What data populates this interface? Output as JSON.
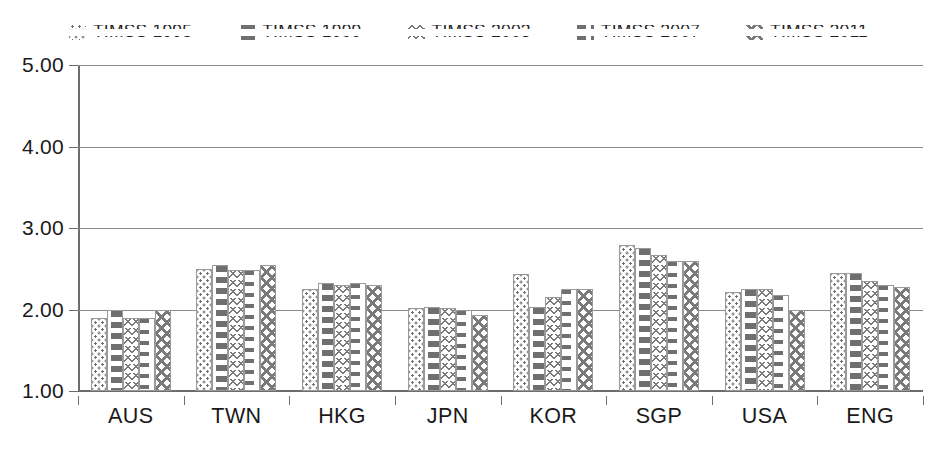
{
  "chart_data": {
    "type": "bar",
    "title": "",
    "subtitle": "",
    "xlabel": "",
    "ylabel": "",
    "ylim": [
      1.0,
      5.0
    ],
    "ytick_step": 1.0,
    "ytick_labels": [
      "1.00",
      "2.00",
      "3.00",
      "4.00",
      "5.00"
    ],
    "ytick_values": [
      1.0,
      2.0,
      3.0,
      4.0,
      5.0
    ],
    "grid": "horizontal",
    "legend_position": "top-center",
    "baseline": 1.0,
    "categories": [
      "AUS",
      "TWN",
      "HKG",
      "JPN",
      "KOR",
      "SGP",
      "USA",
      "ENG"
    ],
    "series": [
      {
        "name": "TIMSS 1995",
        "pattern": "dots",
        "values": [
          1.9,
          2.5,
          2.25,
          2.02,
          2.43,
          2.79,
          2.22,
          2.45
        ]
      },
      {
        "name": "TIMSS 1999",
        "pattern": "vertical-dash",
        "values": [
          2.0,
          2.55,
          2.33,
          2.03,
          2.03,
          2.75,
          2.25,
          2.45
        ]
      },
      {
        "name": "TIMSS 2003",
        "pattern": "chevron",
        "values": [
          1.9,
          2.48,
          2.3,
          2.02,
          2.15,
          2.67,
          2.25,
          2.35
        ]
      },
      {
        "name": "TIMSS 2007",
        "pattern": "horizontal-dash",
        "values": [
          1.9,
          2.48,
          2.33,
          2.0,
          2.25,
          2.6,
          2.18,
          2.3
        ]
      },
      {
        "name": "TIMSS 2011",
        "pattern": "cross",
        "values": [
          2.0,
          2.55,
          2.3,
          1.93,
          2.25,
          2.6,
          2.0,
          2.28
        ]
      }
    ]
  },
  "legend": {
    "items": [
      {
        "label": "TIMSS 1995",
        "swatch": "dots-swatch-icon"
      },
      {
        "label": "TIMSS 1999",
        "swatch": "vertical-dash-swatch-icon"
      },
      {
        "label": "TIMSS 2003",
        "swatch": "chevron-swatch-icon"
      },
      {
        "label": "TIMSS 2007",
        "swatch": "horizontal-dash-swatch-icon"
      },
      {
        "label": "TIMSS 2011",
        "swatch": "cross-swatch-icon"
      }
    ]
  },
  "colors": {
    "axis": "#6d6d6d",
    "grid": "#8a8a8a",
    "pattern": "#7a7a7a",
    "text": "#1a1a1a",
    "background": "#ffffff"
  }
}
